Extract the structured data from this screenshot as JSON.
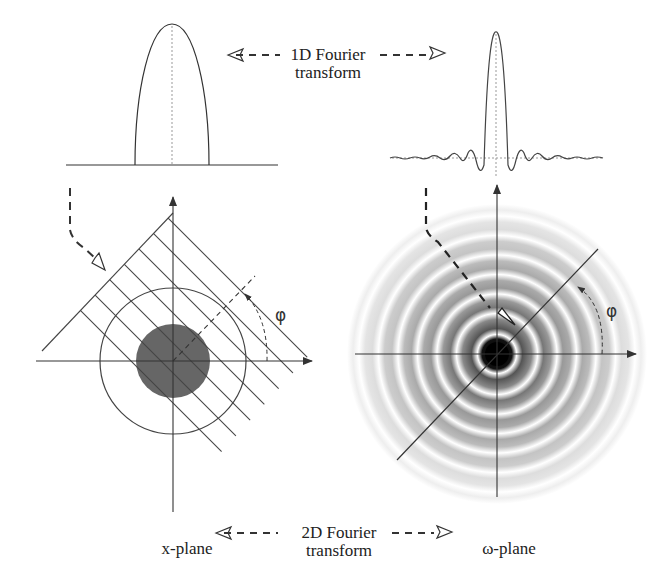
{
  "top_label": {
    "line1": "1D Fourier",
    "line2": "transform"
  },
  "bottom_label": {
    "line1": "2D Fourier",
    "line2": "transform"
  },
  "left_plane_label": "x-plane",
  "right_plane_label": "ω-plane",
  "angle_label_left": "φ",
  "angle_label_right": "φ",
  "panels": {
    "top_left": "projection profile (semi-ellipse)",
    "top_right": "1D transform (sinc-like oscillation)",
    "bottom_left": "x-plane: disk with parallel projection lines at angle φ",
    "bottom_right": "ω-plane: concentric ring pattern with radial line at angle φ"
  },
  "colors": {
    "ink": "#333333",
    "disk_fill": "#666666",
    "dotted": "#999999"
  }
}
